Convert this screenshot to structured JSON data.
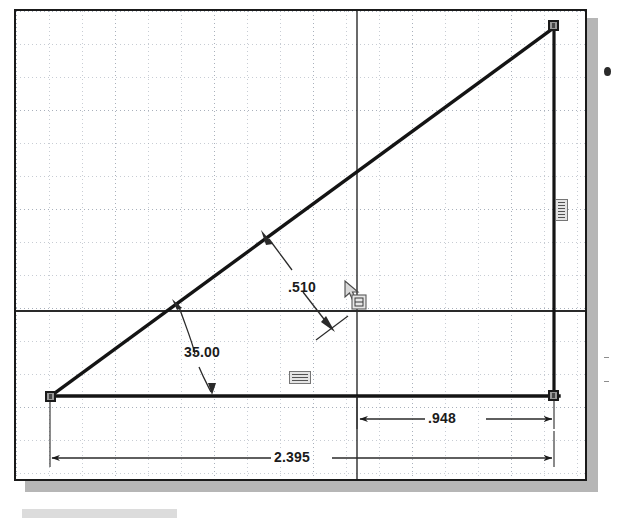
{
  "app": {
    "view_title": "Sketch",
    "units_hint": "inches"
  },
  "canvas": {
    "background_color": "#ffffff",
    "grid_color": "#9aa3b0",
    "geometry_color": "#1a1a1a",
    "dimension_color": "#1b1b1b",
    "point_fill_color": "#9a9a9a",
    "shadow_color": "#a9a9a9",
    "grid_spacing_px": 33
  },
  "sketch": {
    "entities": [
      {
        "name": "hypotenuse-line",
        "type": "line",
        "x1": 48,
        "y1": 395,
        "x2": 551,
        "y2": 25
      },
      {
        "name": "base-line",
        "type": "line",
        "x1": 44,
        "y1": 396,
        "x2": 556,
        "y2": 396
      },
      {
        "name": "vertical-line",
        "type": "line",
        "x1": 551,
        "y1": 22,
        "x2": 551,
        "y2": 398
      },
      {
        "name": "horizontal-axis-line",
        "type": "line",
        "x1": 16,
        "y1": 311,
        "x2": 585,
        "y2": 311
      },
      {
        "name": "vertical-axis-line",
        "type": "line",
        "x1": 355,
        "y1": 11,
        "x2": 355,
        "y2": 479
      }
    ],
    "points": [
      {
        "name": "origin-point",
        "x": 48,
        "y": 395
      },
      {
        "name": "top-right-point",
        "x": 551,
        "y": 22
      },
      {
        "name": "bottom-right-point",
        "x": 551,
        "y": 396
      }
    ]
  },
  "dimensions": [
    {
      "name": "angle-dimension",
      "label": "35.00",
      "type": "angular",
      "value": 35.0,
      "unit": "deg",
      "text_x": 182,
      "text_y": 342
    },
    {
      "name": "length-dimension-510",
      "label": ".510",
      "type": "linear",
      "value": 0.51,
      "unit": "in",
      "text_x": 290,
      "text_y": 280
    },
    {
      "name": "length-dimension-948",
      "label": ".948",
      "type": "linear",
      "value": 0.948,
      "unit": "in",
      "text_x": 428,
      "text_y": 420
    },
    {
      "name": "length-dimension-2395",
      "label": "2.395",
      "type": "linear",
      "value": 2.395,
      "unit": "in",
      "text_x": 286,
      "text_y": 458
    }
  ],
  "relations": [
    {
      "name": "relation-icon-vertical",
      "x": 553,
      "y": 197,
      "w": 13,
      "h": 20
    },
    {
      "name": "relation-icon-horizontal",
      "x": 287,
      "y": 369,
      "w": 20,
      "h": 13
    }
  ],
  "cursor": {
    "name": "smart-dimension-cursor",
    "x": 340,
    "y": 280,
    "tool": "smart-dimension"
  },
  "edge_marks": [
    {
      "name": "edge-bullet",
      "x": 606,
      "y": 70
    },
    {
      "name": "edge-tick-upper",
      "x": 606,
      "y": 357
    },
    {
      "name": "edge-tick-lower",
      "x": 606,
      "y": 381
    }
  ]
}
